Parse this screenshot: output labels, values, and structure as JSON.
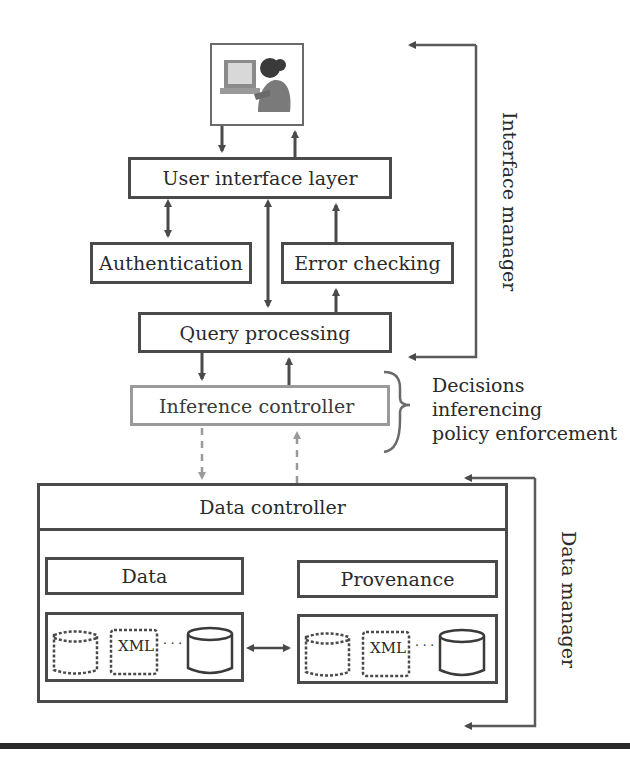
{
  "diagram": {
    "user_icon": "user-at-computer-icon",
    "boxes": {
      "user_interface_layer": "User interface layer",
      "authentication": "Authentication",
      "error_checking": "Error checking",
      "query_processing": "Query processing",
      "inference_controller": "Inference controller",
      "data_controller": "Data controller",
      "data": "Data",
      "provenance": "Provenance"
    },
    "stores": {
      "left": {
        "xml_label": "XML",
        "ellipsis": "· · ·"
      },
      "right": {
        "xml_label": "XML",
        "ellipsis": "· · ·"
      }
    },
    "annotations": {
      "inference_brace_lines": [
        "Decisions",
        "inferencing",
        "policy enforcement"
      ],
      "interface_manager": "Interface manager",
      "data_manager": "Data manager"
    },
    "colors": {
      "stroke": "#4a4a4a",
      "light_stroke": "#9a9a9a",
      "text": "#2a2a2a"
    }
  }
}
